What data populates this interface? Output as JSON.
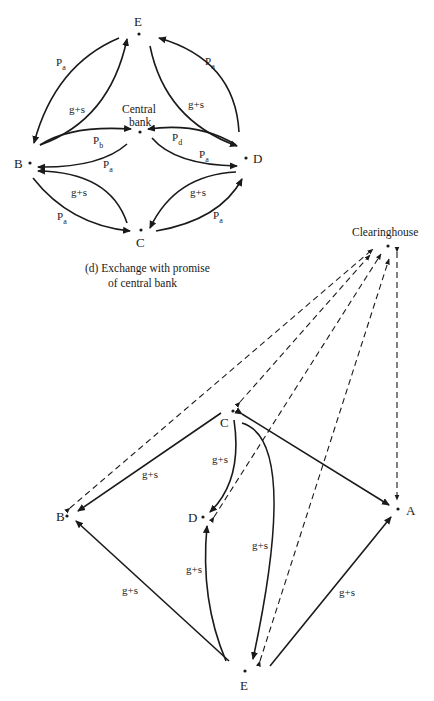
{
  "figure_d": {
    "caption_line1": "(d) Exchange with promise",
    "caption_line2": "of central bank",
    "nodes": {
      "E": "E",
      "B": "B",
      "C": "C",
      "D": "D",
      "central_bank_line1": "Central",
      "central_bank_line2": "bank"
    },
    "edge_labels": {
      "pa": "P",
      "pa_sub": "a",
      "pb": "P",
      "pb_sub": "b",
      "pd": "P",
      "pd_sub": "d",
      "gs": "g+s"
    },
    "edges": [
      {
        "from": "B",
        "to": "E",
        "label": "Pa"
      },
      {
        "from": "E",
        "to": "B",
        "label": "g+s"
      },
      {
        "from": "D",
        "to": "E",
        "label": "Pa"
      },
      {
        "from": "E",
        "to": "D",
        "label": "g+s"
      },
      {
        "from": "B",
        "to": "Central bank",
        "label": "Pb"
      },
      {
        "from": "Central bank",
        "to": "B",
        "label": "Pa"
      },
      {
        "from": "D",
        "to": "Central bank",
        "label": "Pd"
      },
      {
        "from": "Central bank",
        "to": "D",
        "label": "Pa"
      },
      {
        "from": "C",
        "to": "B",
        "label": "g+s"
      },
      {
        "from": "B",
        "to": "C",
        "label": "Pa"
      },
      {
        "from": "D",
        "to": "C",
        "label": "g+s"
      },
      {
        "from": "C",
        "to": "D",
        "label": "Pa"
      }
    ]
  },
  "figure_clearing": {
    "nodes": {
      "clearinghouse": "Clearinghouse",
      "A": "A",
      "B": "B",
      "C": "C",
      "D": "D",
      "E": "E"
    },
    "edge_label": "g+s",
    "edges": [
      {
        "from": "C",
        "to": "B",
        "label": "g+s",
        "style": "solid"
      },
      {
        "from": "C",
        "to": "D",
        "label": "g+s",
        "style": "solid"
      },
      {
        "from": "C",
        "to": "E",
        "label": "g+s",
        "style": "solid"
      },
      {
        "from": "A",
        "to": "C",
        "label": "",
        "style": "solid",
        "bidirectional": true
      },
      {
        "from": "E",
        "to": "B",
        "label": "g+s",
        "style": "solid"
      },
      {
        "from": "E",
        "to": "D",
        "label": "g+s",
        "style": "solid"
      },
      {
        "from": "E",
        "to": "A",
        "label": "g+s",
        "style": "solid"
      },
      {
        "from": "Clearinghouse",
        "to": "B",
        "style": "dashed",
        "bidirectional": true
      },
      {
        "from": "Clearinghouse",
        "to": "C",
        "style": "dashed",
        "bidirectional": true
      },
      {
        "from": "Clearinghouse",
        "to": "D",
        "style": "dashed",
        "bidirectional": true
      },
      {
        "from": "Clearinghouse",
        "to": "E",
        "style": "dashed",
        "bidirectional": true
      },
      {
        "from": "Clearinghouse",
        "to": "A",
        "style": "dashed",
        "bidirectional": true
      }
    ]
  }
}
